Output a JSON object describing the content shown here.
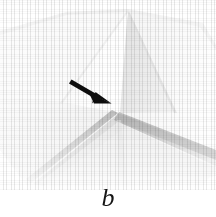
{
  "figure": {
    "caption_label": "b",
    "arrow_annotation": {
      "icon_name": "annotation-arrow-icon",
      "direction": "down-right",
      "color": "#101010",
      "points_to": "central fold crease / valley vertex",
      "tail_x": 72,
      "tail_y": 81,
      "tip_x": 111,
      "tip_y": 103
    },
    "background_color": "#ffffff",
    "geometry": {
      "apex_x": 128,
      "apex_y": 9,
      "vertex_x": 118,
      "vertex_y": 113,
      "left_tip_x": 31,
      "left_tip_y": 183
    },
    "palette": {
      "paper_white": "#fbfbfb",
      "paper_light": "#f2f2f2",
      "facet_left_bright": "#fdfdfd",
      "facet_right_light": "#eaeaea",
      "facet_right_mid": "#e2e2e2",
      "crease_shadow_mid": "#cfcfcf",
      "crease_shadow_dark": "#bdbdbd",
      "chevron_shadow": "#b9b9b9",
      "lower_field": "#efefef",
      "edge_soft_gray": "#e6e6e6"
    }
  }
}
